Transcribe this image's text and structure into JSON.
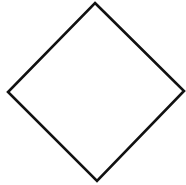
{
  "diagram": {
    "shape": "diamond",
    "background": "#ffffff",
    "stroke_color": "#111111",
    "fill_color": "#ffffff",
    "stroke_width": 2.6,
    "vertices": {
      "top": [
        95,
        3
      ],
      "right": [
        184,
        91
      ],
      "bottom": [
        97,
        181
      ],
      "left": [
        8,
        92
      ]
    }
  }
}
